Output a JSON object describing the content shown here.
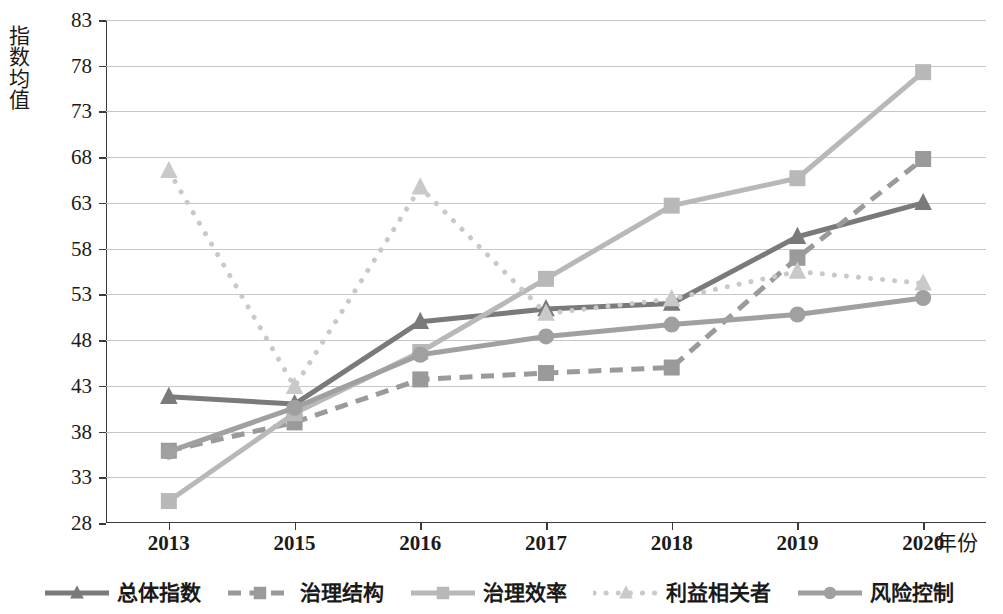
{
  "chart_data": {
    "type": "line",
    "title": "",
    "xlabel": "年份",
    "ylabel": "指数均值",
    "categories": [
      "2013",
      "2015",
      "2016",
      "2017",
      "2018",
      "2019",
      "2020"
    ],
    "ylim": [
      28,
      83
    ],
    "yticks": [
      28,
      33,
      38,
      43,
      48,
      53,
      58,
      63,
      68,
      73,
      78,
      83
    ],
    "grid": true,
    "legend_position": "bottom",
    "series": [
      {
        "name": "总体指数",
        "color": "#7a7a7a",
        "marker": "triangle",
        "dash": "solid",
        "values": [
          41.8,
          41.0,
          50.0,
          51.4,
          52.0,
          59.3,
          63.0
        ]
      },
      {
        "name": "治理结构",
        "color": "#9a9a9a",
        "marker": "square",
        "dash": "dashed",
        "values": [
          35.9,
          39.0,
          43.7,
          44.4,
          45.0,
          57.0,
          67.8
        ]
      },
      {
        "name": "治理效率",
        "color": "#b8b8b8",
        "marker": "square",
        "dash": "solid",
        "values": [
          30.4,
          40.0,
          46.7,
          54.7,
          62.7,
          65.7,
          77.3
        ]
      },
      {
        "name": "利益相关者",
        "color": "#c9c9c9",
        "marker": "triangle",
        "dash": "dotted",
        "values": [
          66.5,
          42.9,
          64.7,
          50.9,
          52.5,
          55.5,
          54.2
        ]
      },
      {
        "name": "风险控制",
        "color": "#a0a0a0",
        "marker": "circle",
        "dash": "solid",
        "values": [
          35.8,
          40.6,
          46.4,
          48.4,
          49.7,
          50.8,
          52.6
        ]
      }
    ]
  },
  "axis": {
    "y_title": "指数均值",
    "x_title": "年份"
  }
}
